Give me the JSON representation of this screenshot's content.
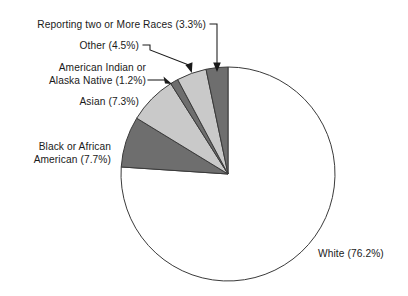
{
  "chart_data": {
    "type": "pie",
    "title": "",
    "subtitle": "",
    "xlabel": "",
    "ylabel": "",
    "legend_position": "none",
    "grid": false,
    "units": "percent",
    "start_angle_deg": -90,
    "direction": "counterclockwise",
    "categories": [
      "White",
      "Black or African American",
      "Asian",
      "American Indian or Alaska Native",
      "Other",
      "Reporting two or More Races"
    ],
    "values": [
      76.2,
      7.7,
      7.3,
      1.2,
      4.5,
      3.3
    ],
    "slices": [
      {
        "name": "Reporting two or More Races",
        "value": 3.3,
        "label": "Reporting two or More Races (3.3%)",
        "color": "#6e6e6e",
        "tone": "dark-gray"
      },
      {
        "name": "Other",
        "value": 4.5,
        "label": "Other (4.5%)",
        "color": "#c9c9c9",
        "tone": "light-gray"
      },
      {
        "name": "American Indian or Alaska Native",
        "value": 1.2,
        "label_line1": "American Indian or",
        "label_line2": "Alaska Native (1.2%)",
        "color": "#6e6e6e",
        "tone": "dark-gray"
      },
      {
        "name": "Asian",
        "value": 7.3,
        "label": "Asian (7.3%)",
        "color": "#c9c9c9",
        "tone": "light-gray"
      },
      {
        "name": "Black or African American",
        "value": 7.7,
        "label_line1": "Black or African",
        "label_line2": "American (7.7%)",
        "color": "#6e6e6e",
        "tone": "dark-gray"
      },
      {
        "name": "White",
        "value": 76.2,
        "label": "White (76.2%)",
        "color": "#ffffff",
        "tone": "white"
      }
    ],
    "colors": {
      "dark_gray": "#6e6e6e",
      "light_gray": "#c9c9c9",
      "white": "#ffffff",
      "outline": "#3a3a3a",
      "text": "#1a1a1a",
      "background": "#ffffff"
    }
  }
}
